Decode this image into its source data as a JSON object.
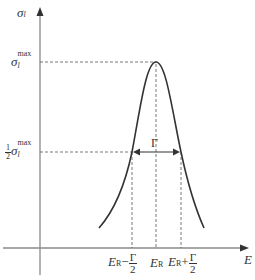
{
  "diagram": {
    "type": "resonance-peak",
    "y_axis_label": {
      "symbol": "σ",
      "subscript": "l"
    },
    "x_axis_label": "E",
    "max_label": {
      "symbol": "σ",
      "subscript": "l",
      "superscript": "max"
    },
    "half_max_label": {
      "coef_num": "1",
      "coef_den": "2",
      "symbol": "σ",
      "subscript": "l",
      "superscript": "max"
    },
    "width_label": "Γ",
    "x_ticks": [
      {
        "base": "E",
        "sub": "R",
        "op": "−",
        "frac_num": "Γ",
        "frac_den": "2"
      },
      {
        "base": "E",
        "sub": "R"
      },
      {
        "base": "E",
        "sub": "R",
        "op": "+",
        "frac_num": "Γ",
        "frac_den": "2"
      }
    ],
    "colors": {
      "axis": "#8a8a8a",
      "curve": "#333333",
      "dash": "#555555"
    }
  }
}
